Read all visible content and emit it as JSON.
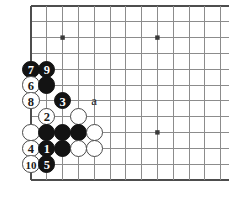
{
  "diagram": {
    "kind": "go-board-diagram",
    "board_size": 19,
    "visible_region": "top-left corner, 12 columns by 10 rows",
    "background_color": "#ffffff",
    "grid_line_color": "#8c8c8c",
    "edge_line_color": "#4d4d4d",
    "black_stone_color": "#131313",
    "white_stone_color": "#ffffff",
    "white_stone_border_color": "#4a4a4a",
    "geometry": {
      "origin_x": 31,
      "origin_y": 6,
      "spacing": 15.8,
      "cols": 13,
      "rows": 12,
      "stone_diameter": 17.4
    },
    "star_points": [
      {
        "col": 2,
        "row": 2
      },
      {
        "col": 8,
        "row": 2
      },
      {
        "col": 8,
        "row": 8
      }
    ],
    "stones": [
      {
        "col": 0,
        "row": 4,
        "color": "black",
        "label": "7"
      },
      {
        "col": 1,
        "row": 4,
        "color": "black",
        "label": "9"
      },
      {
        "col": 0,
        "row": 5,
        "color": "white",
        "label": "6"
      },
      {
        "col": 1,
        "row": 5,
        "color": "black",
        "label": ""
      },
      {
        "col": 0,
        "row": 6,
        "color": "white",
        "label": "8"
      },
      {
        "col": 2,
        "row": 6,
        "color": "black",
        "label": "3"
      },
      {
        "col": 1,
        "row": 7,
        "color": "white",
        "label": "2"
      },
      {
        "col": 3,
        "row": 7,
        "color": "white",
        "label": ""
      },
      {
        "col": 0,
        "row": 8,
        "color": "white",
        "label": ""
      },
      {
        "col": 1,
        "row": 8,
        "color": "black",
        "label": ""
      },
      {
        "col": 2,
        "row": 8,
        "color": "black",
        "label": ""
      },
      {
        "col": 3,
        "row": 8,
        "color": "black",
        "label": ""
      },
      {
        "col": 4,
        "row": 8,
        "color": "white",
        "label": ""
      },
      {
        "col": 0,
        "row": 9,
        "color": "white",
        "label": "4"
      },
      {
        "col": 1,
        "row": 9,
        "color": "black",
        "label": "1"
      },
      {
        "col": 2,
        "row": 9,
        "color": "black",
        "label": ""
      },
      {
        "col": 3,
        "row": 9,
        "color": "white",
        "label": ""
      },
      {
        "col": 4,
        "row": 9,
        "color": "white",
        "label": ""
      },
      {
        "col": 0,
        "row": 10,
        "color": "white",
        "label": "10"
      },
      {
        "col": 1,
        "row": 10,
        "color": "black",
        "label": "5"
      }
    ],
    "letter_markers": [
      {
        "col": 4,
        "row": 6,
        "text": "a"
      }
    ],
    "move_sequence": [
      {
        "number": "1",
        "color": "black"
      },
      {
        "number": "2",
        "color": "white"
      },
      {
        "number": "3",
        "color": "black"
      },
      {
        "number": "4",
        "color": "white"
      },
      {
        "number": "5",
        "color": "black"
      },
      {
        "number": "6",
        "color": "white"
      },
      {
        "number": "7",
        "color": "black"
      },
      {
        "number": "8",
        "color": "white"
      },
      {
        "number": "9",
        "color": "black"
      },
      {
        "number": "10",
        "color": "white"
      }
    ]
  }
}
